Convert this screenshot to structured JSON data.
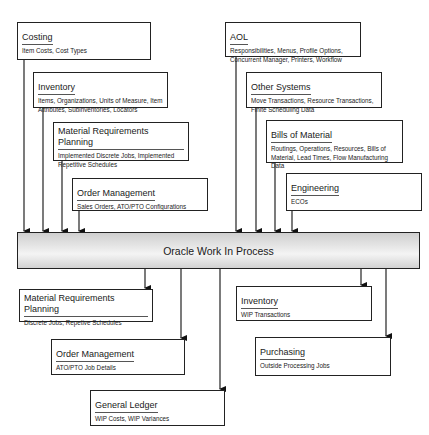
{
  "center": {
    "label": "Oracle Work In Process"
  },
  "inputs_left": [
    {
      "title": "Costing",
      "desc": "Item Costs, Cost Types"
    },
    {
      "title": "Inventory",
      "desc": "Items, Organizations, Units of Measure, Item Attributes, Subinventories, Locators"
    },
    {
      "title": "Material Requirements Planning",
      "desc": "Implemented Discrete Jobs, Implemented Repetitive Schedules"
    },
    {
      "title": "Order Management",
      "desc": "Sales Orders, ATO/PTO Configurations"
    }
  ],
  "inputs_right": [
    {
      "title": "AOL",
      "desc": "Responsibilities, Menus, Profile Options, Concurrent Manager, Printers, Workflow"
    },
    {
      "title": "Other Systems",
      "desc": "Move Transactions, Resource Transactions, Finite Scheduling Data"
    },
    {
      "title": "Bills of Material",
      "desc": "Routings, Operations, Resources, Bills of Material, Lead Times, Flow Manufacturing Data"
    },
    {
      "title": "Engineering",
      "desc": "ECOs"
    }
  ],
  "outputs_left": [
    {
      "title": "Material Requirements Planning",
      "desc": "Discrete Jobs, Repetive Schedules"
    },
    {
      "title": "Order Management",
      "desc": "ATO/PTO Job Details"
    },
    {
      "title": "General Ledger",
      "desc": "WIP Costs, WIP Variances"
    }
  ],
  "outputs_right": [
    {
      "title": "Inventory",
      "desc": "WIP Transactions"
    },
    {
      "title": "Purchasing",
      "desc": "Outside Processing Jobs"
    }
  ]
}
